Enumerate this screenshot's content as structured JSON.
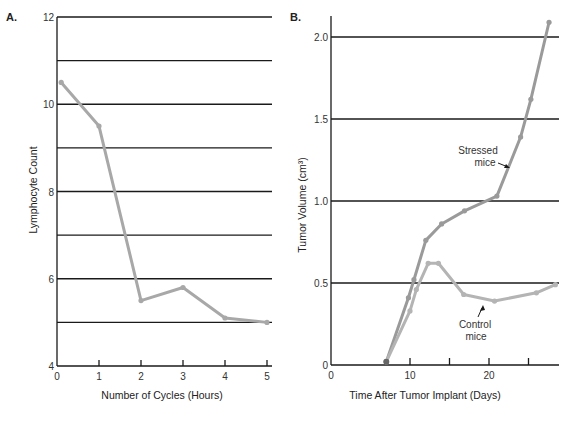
{
  "chart_data": [
    {
      "panel": "A.",
      "type": "line",
      "title": "",
      "xlabel": "Number of Cycles (Hours)",
      "ylabel": "Lymphocyte Count",
      "xlim": [
        0,
        5
      ],
      "ylim": [
        4,
        12
      ],
      "xticks": [
        0,
        1,
        2,
        3,
        4,
        5
      ],
      "yticks": [
        4,
        6,
        8,
        10,
        12
      ],
      "grid": "horizontal lines at every 1 unit (5-12)",
      "series": [
        {
          "name": "Lymphocyte count",
          "x": [
            0.1,
            1,
            2,
            3,
            4,
            5
          ],
          "y": [
            10.5,
            9.5,
            5.5,
            5.8,
            5.1,
            5.0
          ],
          "color": "#a8a8a8"
        }
      ]
    },
    {
      "panel": "B.",
      "type": "line",
      "title": "",
      "xlabel": "Time After Tumor Implant (Days)",
      "ylabel": "Tumor Volume (cm³)",
      "xlim": [
        0,
        28.5
      ],
      "ylim": [
        0,
        2.2
      ],
      "xticks": [
        0,
        10,
        15,
        20,
        25
      ],
      "xtick_labels": [
        "0",
        "10",
        "",
        "20",
        ""
      ],
      "yticks": [
        0,
        0.5,
        1.0,
        1.5,
        2.0
      ],
      "ytick_labels": [
        "0",
        "0.5",
        "1.0",
        "1.5",
        "2.0"
      ],
      "grid": "horizontal lines at 0.5, 1.0, 1.5, 2.0",
      "series": [
        {
          "name": "Stressed mice",
          "x": [
            7,
            9.8,
            10.5,
            12,
            14,
            16.9,
            21,
            24,
            25.3,
            27.6
          ],
          "y": [
            0.02,
            0.41,
            0.52,
            0.76,
            0.86,
            0.94,
            1.03,
            1.39,
            1.62,
            2.09
          ],
          "color": "#9a9a9a"
        },
        {
          "name": "Control mice",
          "x": [
            7,
            10,
            10.8,
            12.3,
            13.6,
            16.8,
            20.7,
            26,
            28.4
          ],
          "y": [
            0.02,
            0.33,
            0.46,
            0.62,
            0.62,
            0.43,
            0.39,
            0.44,
            0.49
          ],
          "color": "#b4b4b4"
        }
      ],
      "annotations": [
        {
          "text_line1": "Stressed",
          "text_line2": "mice",
          "target": "Stressed mice"
        },
        {
          "text_line1": "Control",
          "text_line2": "mice",
          "target": "Control mice"
        }
      ]
    }
  ]
}
